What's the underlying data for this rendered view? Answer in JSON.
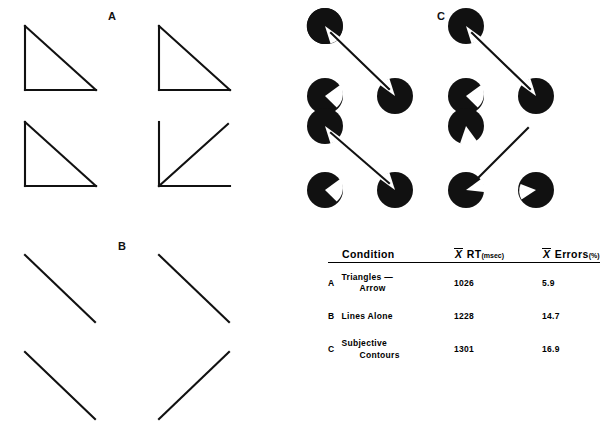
{
  "panels": {
    "a": {
      "letter": "A",
      "name": "triangles-arrow-panel"
    },
    "b": {
      "letter": "B",
      "name": "lines-alone-panel"
    },
    "c": {
      "letter": "C",
      "name": "subjective-contours-panel"
    }
  },
  "table": {
    "headers": {
      "condition": "Condition",
      "rt_mean": "X",
      "rt_label": "RT",
      "rt_unit": "(msec)",
      "err_mean": "X",
      "err_label": "Errors",
      "err_unit": "(%)"
    },
    "rows": [
      {
        "letter": "A",
        "condition_line1": "Triangles —",
        "condition_line2": "Arrow",
        "rt": "1026",
        "errors": "5.9"
      },
      {
        "letter": "B",
        "condition_line1": "Lines Alone",
        "condition_line2": "",
        "rt": "1228",
        "errors": "14.7"
      },
      {
        "letter": "C",
        "condition_line1": "Subjective",
        "condition_line2": "Contours",
        "rt": "1301",
        "errors": "16.9"
      }
    ]
  },
  "colors": {
    "ink": "#000000",
    "background": "#ffffff"
  }
}
